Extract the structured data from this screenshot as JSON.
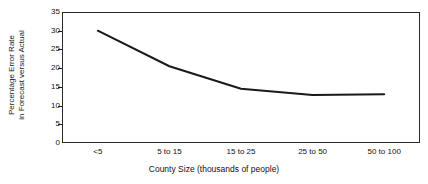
{
  "chart_data": {
    "type": "line",
    "title": "",
    "subtitle": "",
    "xlabel": "County Size (thousands of people)",
    "ylabel": "Percentage Error Rate in Forecast versus Actual",
    "ylabel_line1": "Percentage Error Rate",
    "ylabel_line2": "in Forecast versus Actual",
    "categories": [
      "<5",
      "5 to 15",
      "15 to 25",
      "25 to 50",
      "50 to 100"
    ],
    "values": [
      30,
      20.5,
      14.5,
      12.8,
      13
    ],
    "series": [
      {
        "name": "Percentage Error Rate",
        "values": [
          30,
          20.5,
          14.5,
          12.8,
          13
        ]
      }
    ],
    "ylim": [
      0,
      35
    ],
    "yticks": [
      0,
      5,
      10,
      15,
      20,
      25,
      30,
      35
    ],
    "ytick_labels": [
      "0",
      "5",
      "10",
      "15",
      "20",
      "25",
      "30",
      "35"
    ],
    "xtick_labels": [
      "<5",
      "5 to 15",
      "15 to 25",
      "25 to 50",
      "50 to 100"
    ],
    "grid": false,
    "legend": false,
    "legend_position": "none",
    "line_color": "#1a1a1a",
    "frame_color": "#2b2b2b",
    "background_color": "#ffffff",
    "markers": false
  }
}
